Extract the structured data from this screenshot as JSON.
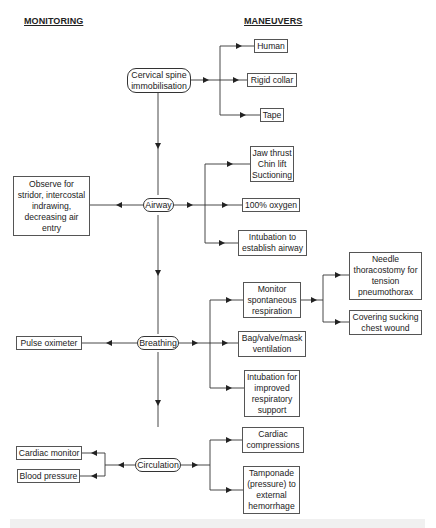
{
  "headers": {
    "monitoring": "MONITORING",
    "maneuvers": "MANEUVERS"
  },
  "stages": [
    {
      "id": "cspine",
      "label": "Cervical spine\nimmobilisation"
    },
    {
      "id": "airway",
      "label": "Airway"
    },
    {
      "id": "breathing",
      "label": "Breathing"
    },
    {
      "id": "circulation",
      "label": "Circulation"
    }
  ],
  "maneuvers": {
    "cspine": [
      "Human",
      "Rigid collar",
      "Tape"
    ],
    "airway": [
      "Jaw thrust\nChin lift\nSuctioning",
      "100% oxygen",
      "Intubation to\nestablish airway"
    ],
    "breathing": [
      "Monitor\nspontaneous\nrespiration",
      "Bag/valve/mask\nventilation",
      "Intubation for\nimproved\nrespiratory\nsupport"
    ],
    "breathing_sub": [
      "Needle\nthoracostomy for\ntension\npneumothorax",
      "Covering sucking\nchest wound"
    ],
    "circulation": [
      "Cardiac\ncompressions",
      "Tamponade\n(pressure) to\nexternal\nhemorrhage"
    ]
  },
  "monitoring": {
    "airway": "Observe for\nstridor, intercostal\nindrawing,\ndecreasing air\nentry",
    "breathing": "Pulse oximeter",
    "circulation": [
      "Cardiac monitor",
      "Blood pressure"
    ]
  },
  "colors": {
    "line": "#333333",
    "box_border": "#555555",
    "background": "#ffffff"
  }
}
